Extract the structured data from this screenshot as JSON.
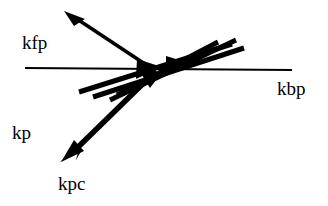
{
  "figure": {
    "type": "vector-diagram",
    "background_color": "#ffffff",
    "stroke_color": "#000000",
    "width": 328,
    "height": 206
  },
  "labels": {
    "kfp": "kfp",
    "kbp": "kbp",
    "kp": "kp",
    "kpc": "kpc"
  },
  "chart_data": {
    "type": "scatter",
    "title": "",
    "xlabel": "",
    "ylabel": "",
    "annotations": [
      "kfp",
      "kbp",
      "kp",
      "kpc"
    ],
    "vertex": {
      "x": 150,
      "y": 68
    },
    "elements": [
      {
        "name": "horizontal-baseline",
        "kind": "thin-line",
        "from": [
          25,
          68
        ],
        "to": [
          292,
          70
        ],
        "stroke_width": 2,
        "labels": [
          "kfp",
          "kbp"
        ]
      },
      {
        "name": "upward-arrow",
        "kind": "thick-arrow",
        "from": [
          150,
          68
        ],
        "to": [
          67,
          12
        ],
        "stroke_width": 4,
        "arrowhead": "to"
      },
      {
        "name": "bundle-line-1",
        "kind": "thick-line",
        "from": [
          79,
          92
        ],
        "to": [
          232,
          44
        ],
        "stroke_width": 5
      },
      {
        "name": "bundle-line-2",
        "kind": "thick-line",
        "from": [
          93,
          97
        ],
        "to": [
          244,
          48
        ],
        "stroke_width": 5
      },
      {
        "name": "bundle-line-3",
        "kind": "thick-line",
        "from": [
          110,
          100
        ],
        "to": [
          236,
          40
        ],
        "stroke_width": 5
      },
      {
        "name": "bundle-line-4",
        "kind": "thick-line",
        "from": [
          117,
          95
        ],
        "to": [
          218,
          42
        ],
        "stroke_width": 5
      },
      {
        "name": "center-arrowhead-left",
        "kind": "arrowhead",
        "at": [
          152,
          67
        ],
        "direction": "right"
      },
      {
        "name": "center-arrowhead-right",
        "kind": "arrowhead",
        "at": [
          180,
          62
        ],
        "direction": "right"
      },
      {
        "name": "downward-arrow",
        "kind": "thick-arrow",
        "from": [
          155,
          72
        ],
        "to": [
          62,
          160
        ],
        "stroke_width": 5,
        "arrowhead": "to",
        "label": "kpc"
      },
      {
        "name": "thin-parallel-line",
        "kind": "thin-line",
        "from": [
          140,
          88
        ],
        "to": [
          64,
          159
        ],
        "stroke_width": 1
      }
    ]
  }
}
